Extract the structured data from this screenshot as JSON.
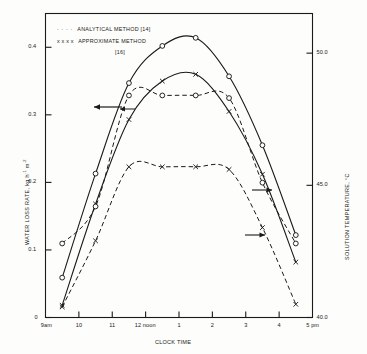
{
  "chart_data": {
    "type": "line",
    "title": "",
    "xlabel": "CLOCK TIME",
    "ylabel": "WATER LOSS RATE, kg h-1 m-2",
    "y2label": "SOLUTION TEMPERATURE, °C",
    "grid": false,
    "legend_position": "top-left",
    "xlim": [
      9,
      17
    ],
    "x_tick_labels": [
      "9am",
      "10",
      "11",
      "12 noon",
      "1",
      "2",
      "3",
      "4",
      "5 pm"
    ],
    "x_tick_values": [
      9,
      10,
      11,
      12,
      13,
      14,
      15,
      16,
      17
    ],
    "ylim": [
      0,
      0.45
    ],
    "y_tick_labels": [
      "0",
      "0.1",
      "0.2",
      "0.3",
      "0.4"
    ],
    "y_tick_values": [
      0,
      0.1,
      0.2,
      0.3,
      0.4
    ],
    "y2lim": [
      40.0,
      51.5
    ],
    "y2_tick_labels": [
      "40.0",
      "45.0",
      "50.0"
    ],
    "y2_tick_values": [
      40.0,
      45.0,
      50.0
    ],
    "legend": [
      {
        "marker": "dotted",
        "label": "ANALYTICAL METHOD [14]"
      },
      {
        "marker": "xxxx",
        "label": "APPROXIMATE METHOD"
      },
      {
        "marker": "",
        "label": "[16]"
      }
    ],
    "annotations": [
      {
        "text": "left-arrow",
        "note": "arrow pointing to left axis from water loss rate curves"
      },
      {
        "text": "left-arrow",
        "note": "second arrow pointing to left axis"
      },
      {
        "text": "right-arrow",
        "note": "arrow pointing to right axis from temperature curves"
      },
      {
        "text": "right-arrow",
        "note": "second arrow pointing to right axis"
      }
    ],
    "series": [
      {
        "name": "ANALYTICAL METHOD [14] - water loss rate",
        "axis": "left",
        "style": "solid",
        "marker": "circle",
        "x": [
          9.5,
          10.5,
          11.5,
          12.5,
          13.5,
          14.5,
          15.5,
          16.5
        ],
        "values": [
          0.059,
          0.213,
          0.347,
          0.402,
          0.414,
          0.357,
          0.255,
          0.122
        ]
      },
      {
        "name": "APPROXIMATE METHOD [16] - water loss rate",
        "axis": "left",
        "style": "solid",
        "marker": "x",
        "x": [
          9.5,
          10.5,
          11.5,
          12.5,
          13.5,
          14.5,
          15.5,
          16.5
        ],
        "values": [
          0.018,
          0.168,
          0.293,
          0.35,
          0.36,
          0.305,
          0.212,
          0.082
        ]
      },
      {
        "name": "ANALYTICAL METHOD [14] - solution temperature",
        "axis": "right",
        "style": "dashed",
        "marker": "circle",
        "x": [
          9.5,
          10.5,
          11.5,
          12.5,
          13.5,
          14.5,
          15.5,
          16.5
        ],
        "values": [
          42.8,
          44.2,
          48.4,
          48.4,
          48.4,
          48.3,
          45.1,
          42.8
        ]
      },
      {
        "name": "APPROXIMATE METHOD [16] - solution temperature",
        "axis": "right",
        "style": "dashed",
        "marker": "x",
        "x": [
          9.5,
          10.5,
          11.5,
          12.5,
          13.5,
          14.5,
          15.5,
          16.5
        ],
        "values": [
          40.4,
          42.9,
          45.7,
          45.7,
          45.7,
          45.6,
          43.4,
          40.5
        ]
      }
    ]
  },
  "axes": {
    "y_left_title_main": "WATER LOSS RATE, kg h",
    "y_left_title_sup1": "-1",
    "y_left_title_mid": "m",
    "y_left_title_sup2": "-2",
    "y_right_title": "SOLUTION TEMPERATURE, °C",
    "x_title": "CLOCK TIME"
  },
  "legend": {
    "line1_marker": "· · · ·",
    "line1_label": "ANALYTICAL METHOD [14]",
    "line2_marker": "x x x x",
    "line2_label": "APPROXIMATE METHOD",
    "line3_label": "[16]"
  }
}
